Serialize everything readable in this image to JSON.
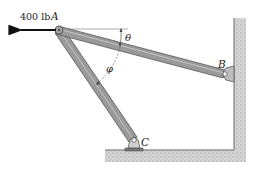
{
  "diagram": {
    "type": "two-member frame / truss statics problem",
    "load": {
      "label": "400 lb",
      "direction": "left",
      "applied_at": "A"
    },
    "points": [
      {
        "id": "A",
        "label": "A",
        "role": "pin joint, load application point"
      },
      {
        "id": "B",
        "label": "B",
        "role": "pin support on vertical wall"
      },
      {
        "id": "C",
        "label": "C",
        "role": "pin support on floor"
      }
    ],
    "members": [
      {
        "id": "AB",
        "from": "A",
        "to": "B"
      },
      {
        "id": "AC",
        "from": "A",
        "to": "C"
      }
    ],
    "angles": [
      {
        "symbol": "θ",
        "description": "angle between horizontal at A and member AB"
      },
      {
        "symbol": "φ",
        "description": "angle between members AC and AB"
      }
    ],
    "colors": {
      "member_fill": "#9a9a9a",
      "member_edge": "#555555",
      "ground_fill": "#cfcfcf",
      "arrow": "#111111"
    }
  }
}
